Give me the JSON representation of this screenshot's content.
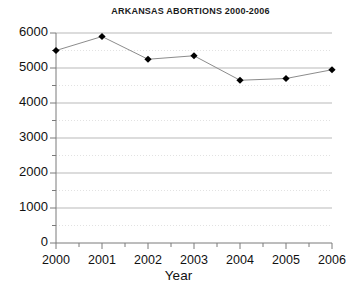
{
  "chart_data": {
    "type": "line",
    "title": "ARKANSAS ABORTIONS 2000-2006",
    "xlabel": "Year",
    "ylabel": "",
    "categories": [
      "2000",
      "2001",
      "2002",
      "2003",
      "2004",
      "2005",
      "2006"
    ],
    "x": [
      2000,
      2001,
      2002,
      2003,
      2004,
      2005,
      2006
    ],
    "values": [
      5500,
      5900,
      5250,
      5350,
      4650,
      4700,
      4950
    ],
    "series": [
      {
        "name": "Abortions",
        "values": [
          5500,
          5900,
          5250,
          5350,
          4650,
          4700,
          4950
        ]
      }
    ],
    "ylim": [
      0,
      6000
    ],
    "xlim": [
      2000,
      2006
    ],
    "ytick_labels": [
      "0",
      "1000",
      "2000",
      "3000",
      "4000",
      "5000",
      "6000"
    ],
    "ytick_values": [
      0,
      1000,
      2000,
      3000,
      4000,
      5000,
      6000
    ],
    "yminor_step": 500,
    "xtick_labels": [
      "2000",
      "2001",
      "2002",
      "2003",
      "2004",
      "2005",
      "2006"
    ],
    "grid": "major-solid-gray, minor-dotted-light",
    "legend": "none",
    "marker": "filled-diamond",
    "line_color": "#8c8c8c",
    "marker_color": "#000000",
    "grid_color": "#b9b9b9",
    "minor_grid_color": "#e2e2e2",
    "axis_color": "#7a7a7a",
    "background": "#ffffff"
  }
}
